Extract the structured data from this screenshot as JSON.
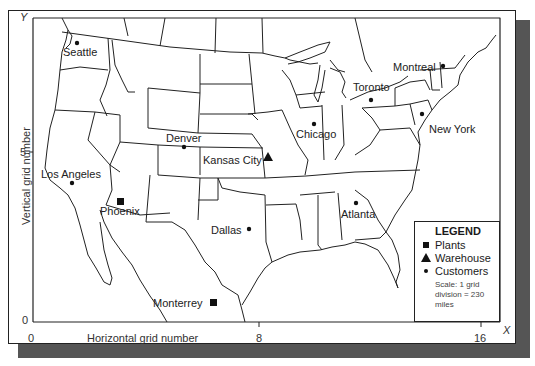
{
  "axes": {
    "x_label": "Horizontal grid number",
    "y_label": "Vertical grid number",
    "x_axis_letter": "X",
    "y_axis_letter": "Y",
    "x_ticks": [
      "0",
      "8",
      "16"
    ],
    "y_ticks": [
      "0",
      "5"
    ]
  },
  "legend": {
    "title": "LEGEND",
    "items": [
      {
        "symbol": "square",
        "label": "Plants"
      },
      {
        "symbol": "triangle",
        "label": "Warehouse"
      },
      {
        "symbol": "circle",
        "label": "Customers"
      }
    ],
    "scale_text": "Scale: 1 grid division = 230 miles"
  },
  "locations": [
    {
      "name": "Seattle",
      "type": "customer"
    },
    {
      "name": "Montreal",
      "type": "customer"
    },
    {
      "name": "Toronto",
      "type": "customer"
    },
    {
      "name": "Denver",
      "type": "customer"
    },
    {
      "name": "Chicago",
      "type": "customer"
    },
    {
      "name": "New York",
      "type": "customer"
    },
    {
      "name": "Kansas City",
      "type": "warehouse"
    },
    {
      "name": "Los Angeles",
      "type": "customer"
    },
    {
      "name": "Phoenix",
      "type": "plant"
    },
    {
      "name": "Atlanta",
      "type": "customer"
    },
    {
      "name": "Dallas",
      "type": "customer"
    },
    {
      "name": "Monterrey",
      "type": "plant"
    }
  ],
  "colors": {
    "line": "#222222",
    "shadow": "#555555",
    "background": "#ffffff"
  }
}
